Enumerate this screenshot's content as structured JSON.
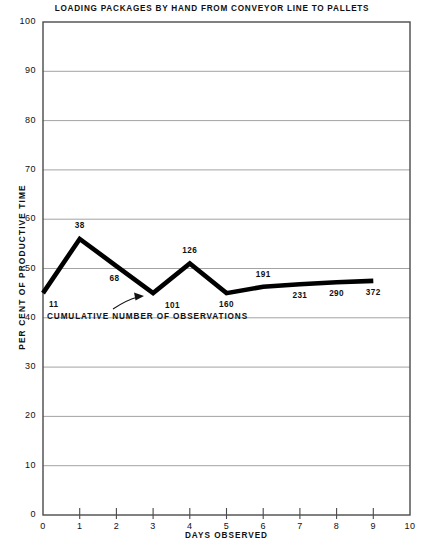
{
  "chart_data": {
    "type": "line",
    "title": "LOADING PACKAGES BY HAND FROM CONVEYOR LINE TO PALLETS",
    "xlabel": "DAYS OBSERVED",
    "ylabel": "PER CENT OF PRODUCTIVE TIME",
    "xlim": [
      0,
      10
    ],
    "ylim": [
      0,
      100
    ],
    "xticks": [
      "0",
      "1",
      "2",
      "3",
      "4",
      "5",
      "6",
      "7",
      "8",
      "9",
      "10"
    ],
    "yticks": [
      "0",
      "10",
      "20",
      "30",
      "40",
      "50",
      "60",
      "70",
      "80",
      "90",
      "100"
    ],
    "grid": "horizontal",
    "legend": "none",
    "line_color": "#000000",
    "grid_color": "#999999",
    "x": [
      0,
      1,
      2,
      3,
      4,
      5,
      6,
      7,
      8,
      9
    ],
    "values": [
      45.0,
      56.0,
      50.5,
      45.0,
      51.0,
      45.0,
      46.3,
      46.8,
      47.2,
      47.5
    ],
    "point_labels": [
      "11",
      "38",
      "68",
      "101",
      "126",
      "160",
      "191",
      "231",
      "290",
      "372"
    ],
    "annotation": {
      "caption": "CUMULATIVE NUMBER OF OBSERVATIONS",
      "arrow_target_label": "101"
    }
  }
}
